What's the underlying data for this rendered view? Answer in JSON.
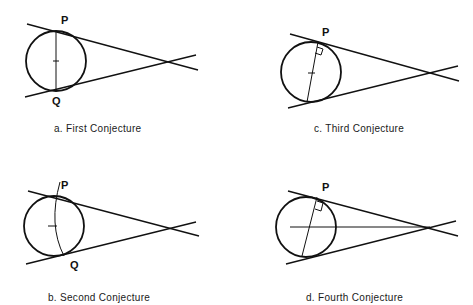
{
  "panels": [
    {
      "id": "a",
      "caption": "a. First Conjecture",
      "labels": {
        "P": "P",
        "Q": "Q"
      }
    },
    {
      "id": "b",
      "caption": "b. Second Conjecture",
      "labels": {
        "P": "P",
        "Q": "Q"
      }
    },
    {
      "id": "c",
      "caption": "c. Third Conjecture",
      "labels": {
        "P": "P"
      }
    },
    {
      "id": "d",
      "caption": "d. Fourth Conjecture",
      "labels": {
        "P": "P"
      }
    }
  ]
}
